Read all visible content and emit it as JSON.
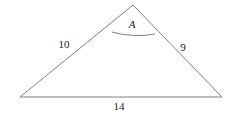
{
  "figure": {
    "type": "geometry-diagram",
    "shape": "triangle",
    "background_color": "#ffffff",
    "stroke_color": "#808080",
    "stroke_width": 1,
    "text_color": "#1a1a1a",
    "width": 231,
    "height": 114,
    "vertices": [
      {
        "name": "apex",
        "x": 133,
        "y": 5
      },
      {
        "name": "bottom-left",
        "x": 20,
        "y": 97
      },
      {
        "name": "bottom-right",
        "x": 222,
        "y": 97
      }
    ],
    "angle_arc": {
      "at_vertex": "apex",
      "radius": 28,
      "start_x": 112,
      "start_y": 32,
      "end_x": 155,
      "end_y": 34,
      "sweep_x": 133,
      "sweep_y": 38
    },
    "labels": {
      "angle": {
        "text": "A",
        "x": 132,
        "y": 24,
        "italic": true
      },
      "left_side": {
        "text": "10",
        "x": 64,
        "y": 44
      },
      "right_side": {
        "text": "9",
        "x": 183,
        "y": 47
      },
      "base_side": {
        "text": "14",
        "x": 119,
        "y": 106
      }
    }
  }
}
